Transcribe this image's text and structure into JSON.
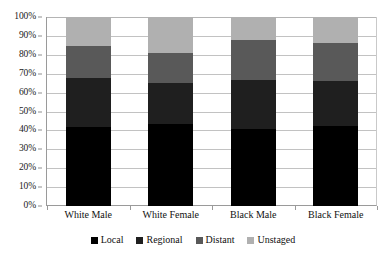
{
  "chart_data": {
    "type": "bar",
    "stacked": true,
    "stack_mode": "percent",
    "title": "",
    "subtitle": "",
    "xlabel": "",
    "ylabel": "",
    "ylim": [
      0,
      100
    ],
    "ytick_labels": [
      "100%",
      "90%",
      "80%",
      "70%",
      "60%",
      "50%",
      "40%",
      "30%",
      "20%",
      "10%",
      "0%"
    ],
    "ytick_values": [
      100,
      90,
      80,
      70,
      60,
      50,
      40,
      30,
      20,
      10,
      0
    ],
    "grid": true,
    "grid_axis": "y",
    "legend_position": "bottom",
    "categories": [
      "White Male",
      "White Female",
      "Black Male",
      "Black Female"
    ],
    "series": [
      {
        "name": "Local",
        "color": "#000000",
        "values": [
          42.0,
          43.5,
          40.5,
          42.5
        ]
      },
      {
        "name": "Regional",
        "color": "#1f1f1f",
        "values": [
          26.0,
          21.5,
          26.0,
          23.5
        ]
      },
      {
        "name": "Distant",
        "color": "#595959",
        "values": [
          16.5,
          16.0,
          21.5,
          20.0
        ]
      },
      {
        "name": "Unstaged",
        "color": "#b0b0b0",
        "values": [
          15.5,
          19.0,
          12.0,
          14.0
        ]
      }
    ],
    "cumulative_tops": {
      "White Male": [
        42.0,
        68.0,
        84.5,
        100.0
      ],
      "White Female": [
        43.5,
        65.0,
        81.0,
        100.0
      ],
      "Black Male": [
        40.5,
        66.5,
        88.0,
        100.0
      ],
      "Black Female": [
        42.5,
        66.0,
        86.0,
        100.0
      ]
    },
    "annotations": []
  },
  "legend": {
    "items": [
      {
        "label": "Local",
        "color": "#000000"
      },
      {
        "label": "Regional",
        "color": "#1f1f1f"
      },
      {
        "label": "Distant",
        "color": "#595959"
      },
      {
        "label": "Unstaged",
        "color": "#b0b0b0"
      }
    ]
  },
  "colors": {
    "background": "#ffffff",
    "gridline": "#c2c2c2",
    "axis_line": "#9a9a9a",
    "text": "#111111"
  }
}
